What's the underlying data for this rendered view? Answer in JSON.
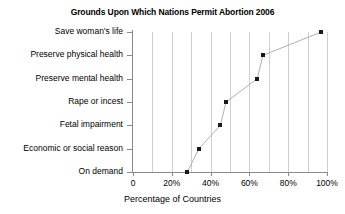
{
  "chart_data": {
    "type": "scatter",
    "title": "Grounds Upon Which Nations Permit Abortion 2006",
    "xlabel": "Percentage of Countries",
    "ylabel": "",
    "categories": [
      "Save woman's life",
      "Preserve physical health",
      "Preserve mental health",
      "Rape or incest",
      "Fetal impairment",
      "Economic or social reason",
      "On demand"
    ],
    "values": [
      97,
      67,
      64,
      48,
      45,
      34,
      28
    ],
    "points": [
      {
        "category": "On demand",
        "value": 28
      },
      {
        "category": "Economic or social reason",
        "value": 34
      },
      {
        "category": "Fetal impairment",
        "value": 45
      },
      {
        "category": "Rape or incest",
        "value": 48
      },
      {
        "category": "Preserve mental health",
        "value": 64
      },
      {
        "category": "Preserve physical health",
        "value": 67
      },
      {
        "category": "Save woman's life",
        "value": 97
      }
    ],
    "xlim": [
      0,
      100
    ],
    "xticks": [
      0,
      20,
      40,
      60,
      80,
      100
    ],
    "xticklabels": [
      "0",
      "20%",
      "40%",
      "60%",
      "80%",
      "100%"
    ],
    "gridlines_x": [
      10,
      20,
      30,
      40,
      50,
      60,
      70,
      80,
      90,
      100
    ],
    "grid": true,
    "legend": "none",
    "marker_color": "#1a1a1a",
    "line_color": "#b0b0b0",
    "grid_color": "#cfcfcf",
    "axis_color": "#8a8a8a",
    "background_color": "#ffffff"
  }
}
